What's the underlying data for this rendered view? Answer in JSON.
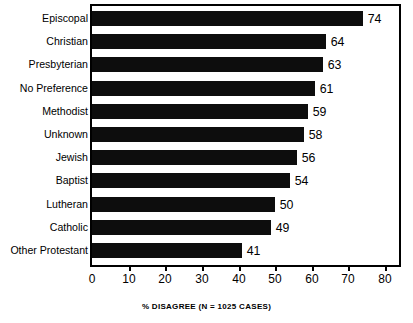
{
  "chart_data": {
    "type": "bar",
    "orientation": "horizontal",
    "title": "",
    "subtitle": "",
    "xlabel": "% DISAGREE (N = 1025 CASES)",
    "ylabel": "",
    "xlim": [
      0,
      80
    ],
    "xticks": [
      0,
      10,
      20,
      30,
      40,
      50,
      60,
      70,
      80
    ],
    "xtick_labels": [
      "0",
      "10",
      "20",
      "30",
      "40",
      "50",
      "60",
      "70",
      "80"
    ],
    "grid": false,
    "legend": null,
    "bar_color": "#0d0d0d",
    "frame_color": "#000000",
    "background": "#ffffff",
    "categories": [
      "Episcopal",
      "Christian",
      "Presbyterian",
      "No Preference",
      "Methodist",
      "Unknown",
      "Jewish",
      "Baptist",
      "Lutheran",
      "Catholic",
      "Other Protestant"
    ],
    "values": [
      74,
      64,
      63,
      61,
      59,
      58,
      56,
      54,
      50,
      49,
      41
    ],
    "value_labels": [
      "74",
      "64",
      "63",
      "61",
      "59",
      "58",
      "56",
      "54",
      "50",
      "49",
      "41"
    ]
  }
}
